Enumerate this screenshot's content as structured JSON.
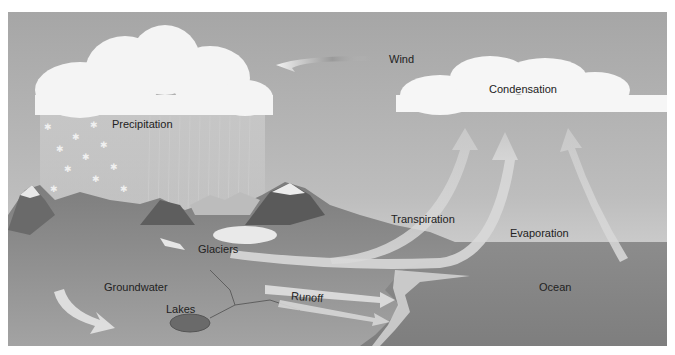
{
  "diagram": {
    "type": "water-cycle",
    "colors": {
      "sky_top": "#a9a9a9",
      "sky_bottom": "#e2e2e2",
      "ocean": "#8a8a8a",
      "land": "#8f8f8f",
      "cloud": "#f4f4f4",
      "arrow": "#d4d4d4",
      "label": "#222222"
    },
    "labels": {
      "wind": "Wind",
      "condensation": "Condensation",
      "precipitation": "Precipitation",
      "transpiration": "Transpiration",
      "evaporation": "Evaporation",
      "glaciers": "Glaciers",
      "groundwater": "Groundwater",
      "runoff": "Runoff",
      "lakes": "Lakes",
      "ocean": "Ocean"
    }
  }
}
